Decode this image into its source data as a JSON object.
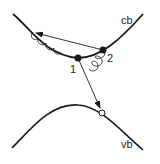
{
  "diagram": {
    "bands": {
      "conduction": {
        "label": "cb"
      },
      "valence": {
        "label": "vb"
      }
    },
    "points": [
      {
        "id": "1",
        "label": "1",
        "type": "filled"
      },
      {
        "id": "2",
        "label": "2",
        "type": "filled"
      },
      {
        "id": "hole",
        "label": "",
        "type": "open"
      }
    ],
    "colors": {
      "line": "#1a1a1a",
      "background": "#ffffff"
    }
  }
}
